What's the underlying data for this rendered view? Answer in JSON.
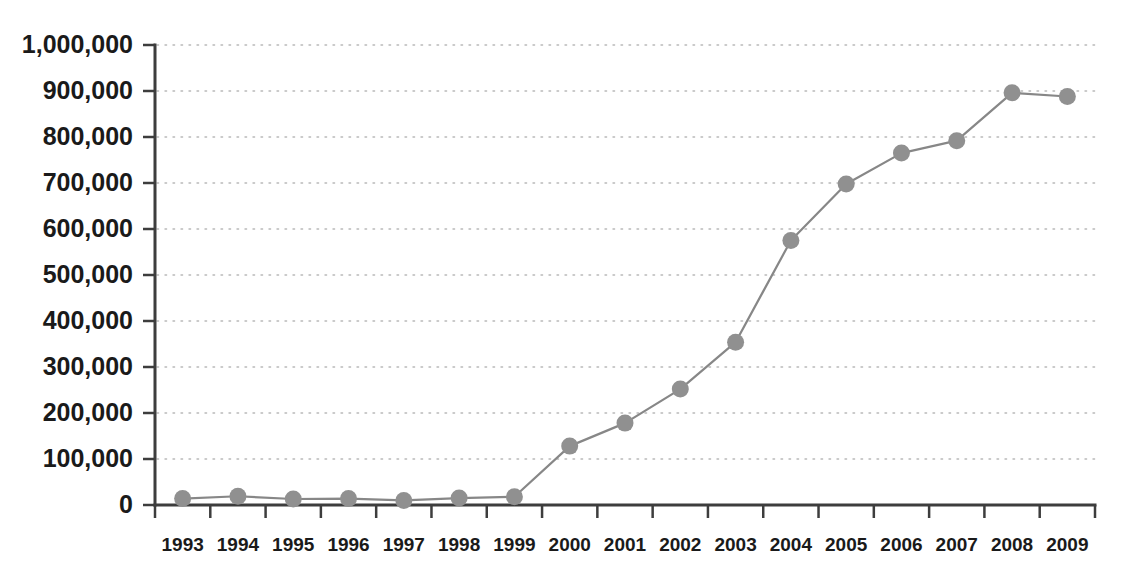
{
  "chart_data": {
    "type": "line",
    "title": "",
    "subtitle": "",
    "xlabel": "",
    "ylabel": "",
    "categories": [
      "1993",
      "1994",
      "1995",
      "1996",
      "1997",
      "1998",
      "1999",
      "2000",
      "2001",
      "2002",
      "2003",
      "2004",
      "2005",
      "2006",
      "2007",
      "2008",
      "2009"
    ],
    "series": [
      {
        "name": "Series 1",
        "values": [
          14000,
          19000,
          13000,
          14000,
          10000,
          15000,
          18000,
          128000,
          178000,
          252000,
          354000,
          575000,
          698000,
          765000,
          792000,
          896000,
          888000
        ]
      }
    ],
    "ylim": [
      0,
      1000000
    ],
    "ytick_values": [
      0,
      100000,
      200000,
      300000,
      400000,
      500000,
      600000,
      700000,
      800000,
      900000,
      1000000
    ],
    "ytick_labels": [
      "0",
      "100,000",
      "200,000",
      "300,000",
      "400,000",
      "500,000",
      "600,000",
      "700,000",
      "800,000",
      "900,000",
      "1,000,000"
    ],
    "xtick_labels": [
      "1993",
      "1994",
      "1995",
      "1996",
      "1997",
      "1998",
      "1999",
      "2000",
      "2001",
      "2002",
      "2003",
      "2004",
      "2005",
      "2006",
      "2007",
      "2008",
      "2009"
    ],
    "grid": {
      "horizontal": true,
      "vertical": false,
      "style": "dotted"
    },
    "legend": {
      "visible": false,
      "position": "none",
      "entries": []
    },
    "annotations": [],
    "colors": {
      "line": "#878787",
      "marker": "#909090",
      "axis": "#3d3d3d",
      "gridline": "#b9b9b9",
      "tick_text": "#1a1a1a",
      "background": "#ffffff"
    },
    "marker": {
      "shape": "circle",
      "radius": 8.5
    }
  }
}
